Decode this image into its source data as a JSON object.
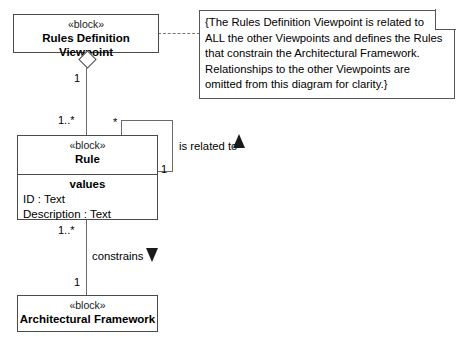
{
  "diagram": {
    "kind": "SysML Block Definition Diagram",
    "blocks": [
      {
        "id": "rules-definition-viewpoint",
        "stereotype": "«block»",
        "name": "Rules Definition Viewpoint"
      },
      {
        "id": "rule",
        "stereotype": "«block»",
        "name": "Rule",
        "compartment_title": "values",
        "properties": [
          "ID : Text",
          "Description : Text"
        ]
      },
      {
        "id": "architectural-framework",
        "stereotype": "«block»",
        "name": "Architectural Framework"
      }
    ],
    "note": {
      "lines": [
        "{The Rules Definition Viewpoint is related to",
        "ALL the other Viewpoints and defines the Rules",
        "that constrain the Architectural Framework.",
        "Relationships to the other Viewpoints are",
        "omitted from this diagram for clarity.}"
      ]
    },
    "relationships": [
      {
        "id": "viewpoint-owns-rule",
        "type": "aggregation",
        "source_multiplicity": "1",
        "target_multiplicity": "1..*"
      },
      {
        "id": "rule-is-related-to-rule",
        "type": "association",
        "label": "is related to",
        "direction_marker": "triangle-up",
        "source_multiplicity": "*",
        "target_multiplicity": "1"
      },
      {
        "id": "rule-constrains-framework",
        "type": "association",
        "label": "constrains",
        "direction_marker": "triangle-down",
        "source_multiplicity": "1..*",
        "target_multiplicity": "1"
      }
    ],
    "multiplicities": {
      "viewpoint_end": "1",
      "rule_top_end": "1..*",
      "rule_self_star": "*",
      "rule_self_one": "1",
      "rule_bottom_end": "1..*",
      "framework_end": "1"
    },
    "labels": {
      "is_related_to": "is related to",
      "constrains": "constrains"
    }
  }
}
